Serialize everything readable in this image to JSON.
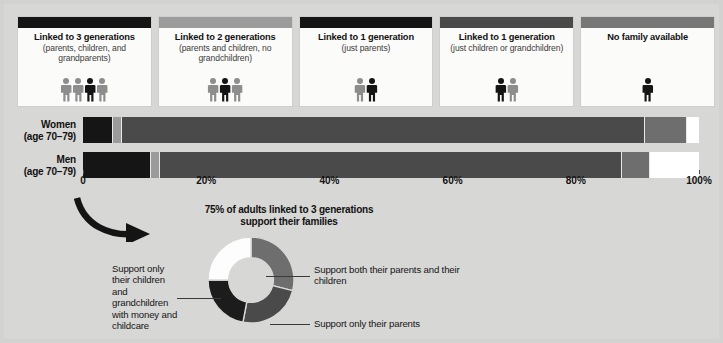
{
  "colors": {
    "background": "#d7d7d5",
    "card_bg": "#fbfbfa",
    "black": "#151515",
    "dark_gray": "#4a4a4a",
    "mid_gray": "#6e6e6e",
    "light_gray": "#9b9b9b",
    "pale_gray": "#c4c4c4",
    "white": "#ffffff"
  },
  "cards": [
    {
      "bar_color": "#151515",
      "title": "Linked to 3 generations",
      "subtitle": "(parents, children, and grandparents)",
      "figures": [
        "#8d8d8d",
        "#8d8d8d",
        "#151515",
        "#8d8d8d"
      ]
    },
    {
      "bar_color": "#9b9b9b",
      "title": "Linked to 2 generations",
      "subtitle": "(parents and children, no grandchildren)",
      "figures": [
        "#8d8d8d",
        "#151515",
        "#8d8d8d"
      ]
    },
    {
      "bar_color": "#151515",
      "title": "Linked to 1 generation",
      "subtitle": "(just parents)",
      "figures": [
        "#8d8d8d",
        "#151515"
      ]
    },
    {
      "bar_color": "#4a4a4a",
      "title": "Linked to 1 generation",
      "subtitle": "(just children or grandchildren)",
      "figures": [
        "#151515",
        "#8d8d8d"
      ]
    },
    {
      "bar_color": "#777777",
      "title": "No family available",
      "subtitle": "",
      "figures": [
        "#151515"
      ]
    }
  ],
  "chart_data": {
    "type": "bar",
    "orientation": "horizontal",
    "stacked": true,
    "title": "",
    "xlabel": "",
    "ylabel": "",
    "xlim": [
      0,
      100
    ],
    "grid": false,
    "legend_position": "top",
    "categories": [
      "Women (age 70–79)",
      "Men (age 70–79)"
    ],
    "tick_labels": [
      "0",
      "20%",
      "40%",
      "60%",
      "80%",
      "100%"
    ],
    "tick_values": [
      0,
      20,
      40,
      60,
      80,
      100
    ],
    "series": [
      {
        "name": "Linked to 3 generations",
        "color": "#151515",
        "values": [
          4.8,
          10.9
        ]
      },
      {
        "name": "Linked to 2 generations",
        "color": "#9b9b9b",
        "values": [
          1.2,
          1.4
        ]
      },
      {
        "name": "Linked to 1 generation (just parents)",
        "color": "#4a4a4a",
        "values": [
          85.4,
          75.2
        ]
      },
      {
        "name": "Linked to 1 generation (just children or grandchildren)",
        "color": "#6e6e6e",
        "values": [
          6.6,
          4.5
        ]
      },
      {
        "name": "No family available",
        "color": "#ffffff",
        "values": [
          2.0,
          8.0
        ]
      }
    ]
  },
  "rows": [
    {
      "name": "Women",
      "age": "(age 70–79)"
    },
    {
      "name": "Men",
      "age": "(age 70–79)"
    }
  ],
  "callout": {
    "title_line1": "75% of adults linked to 3 generations",
    "title_line2": "support their families"
  },
  "donut_chart": {
    "type": "pie",
    "title": "75% of adults linked to 3 generations support their families",
    "inner_radius_ratio": 0.52,
    "start_angle_deg": -90,
    "labels": [
      "Support both their parents and their children",
      "Support only their parents",
      "Support only their children and grandchildren with money and childcare",
      ""
    ],
    "values": [
      29,
      24,
      22,
      25
    ],
    "colors": [
      "#6e6e6e",
      "#4a4a4a",
      "#1c1c1c",
      "#fdfdfd"
    ]
  },
  "donut_labels": {
    "right_top": "Support both their parents and their children",
    "right_bottom": "Support only their parents",
    "left": "Support only their children and grandchildren with money and childcare"
  }
}
